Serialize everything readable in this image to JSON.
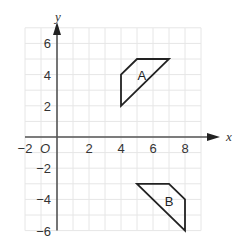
{
  "diagram": {
    "type": "coordinate-grid",
    "axes": {
      "x_label": "x",
      "y_label": "y",
      "origin_label": "O",
      "x_range": [
        -2,
        9
      ],
      "y_range": [
        -6,
        7
      ],
      "x_ticks": [
        {
          "value": -2,
          "label": "−2"
        },
        {
          "value": 2,
          "label": "2"
        },
        {
          "value": 4,
          "label": "4"
        },
        {
          "value": 6,
          "label": "6"
        },
        {
          "value": 8,
          "label": "8"
        }
      ],
      "y_ticks": [
        {
          "value": 6,
          "label": "6"
        },
        {
          "value": 4,
          "label": "4"
        },
        {
          "value": 2,
          "label": "2"
        },
        {
          "value": -2,
          "label": "−2"
        },
        {
          "value": -4,
          "label": "−4"
        },
        {
          "value": -6,
          "label": "−6"
        }
      ],
      "grid": true,
      "grid_color": "#e6e6e6",
      "axis_color": "#555555"
    },
    "shapes": [
      {
        "name": "A",
        "label": "A",
        "vertices": [
          [
            4,
            2
          ],
          [
            4,
            4
          ],
          [
            5,
            5
          ],
          [
            7,
            5
          ]
        ],
        "label_position": [
          5.3,
          4
        ],
        "stroke": "#222222"
      },
      {
        "name": "B",
        "label": "B",
        "vertices": [
          [
            5,
            -3
          ],
          [
            7,
            -3
          ],
          [
            8,
            -4
          ],
          [
            8,
            -6
          ]
        ],
        "label_position": [
          7,
          -4.1
        ],
        "stroke": "#222222"
      }
    ]
  }
}
